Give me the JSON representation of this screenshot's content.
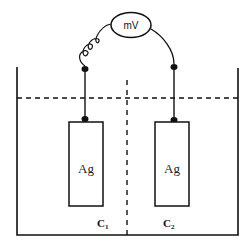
{
  "diagram": {
    "meter": {
      "label": "mV"
    },
    "electrodes": [
      {
        "id": "left",
        "label": "Ag"
      },
      {
        "id": "right",
        "label": "Ag"
      }
    ],
    "compartments": [
      {
        "id": "c1",
        "label": "C",
        "subscript": "1"
      },
      {
        "id": "c2",
        "label": "C",
        "subscript": "2"
      }
    ],
    "colors": {
      "stroke": "#111111",
      "background": "#ffffff"
    }
  }
}
